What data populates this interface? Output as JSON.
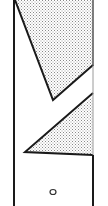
{
  "figure": {
    "type": "technical-line-drawing",
    "colors": {
      "background": "#ffffff",
      "line": "#1a1a1a",
      "hatch_fill": "#b8b8b8"
    },
    "elements": [
      {
        "name": "left-edge-line",
        "shape": "line"
      },
      {
        "name": "right-edge-line",
        "shape": "line"
      },
      {
        "name": "upper-shaded-region",
        "shape": "polygon"
      },
      {
        "name": "lower-shaded-region",
        "shape": "polygon"
      },
      {
        "name": "small-hole-marker",
        "shape": "circle"
      }
    ]
  }
}
